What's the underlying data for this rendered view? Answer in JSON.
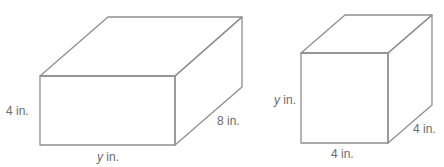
{
  "figures": [
    {
      "name": "rectangular-prism",
      "labels": {
        "height": {
          "var": "",
          "unit": "4 in."
        },
        "width": {
          "var": "y",
          "unit": " in."
        },
        "depth": {
          "var": "",
          "unit": "8 in."
        }
      }
    },
    {
      "name": "cube-prism",
      "labels": {
        "height": {
          "var": "y",
          "unit": " in."
        },
        "width": {
          "var": "",
          "unit": "4 in."
        },
        "depth": {
          "var": "",
          "unit": "4 in."
        }
      }
    }
  ],
  "colors": {
    "front_face": "#f7f7f7",
    "top_face": "#fbfbfb",
    "side_face": "#e9e9e9",
    "edge": "#8f8f8f",
    "label": "#6a6a6a"
  }
}
